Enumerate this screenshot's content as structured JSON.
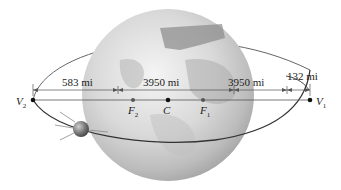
{
  "diagram": {
    "type": "satellite-elliptical-orbit",
    "dimensions": {
      "d1": "583 mi",
      "d2": "3950 mi",
      "d3": "3950 mi",
      "d4": "132 mi"
    },
    "points": {
      "v2": {
        "main": "V",
        "sub": "2"
      },
      "f2": {
        "main": "F",
        "sub": "2"
      },
      "c": {
        "main": "C",
        "sub": ""
      },
      "f1": {
        "main": "F",
        "sub": "1"
      },
      "v1": {
        "main": "V",
        "sub": "1"
      }
    },
    "colors": {
      "orbit": "#3a3a3a",
      "line": "#555555",
      "earth_light": "#f2f2f2",
      "earth_mid": "#c8c8c8",
      "earth_dark": "#9a9a9a",
      "satellite": "#6e6e6e"
    }
  }
}
